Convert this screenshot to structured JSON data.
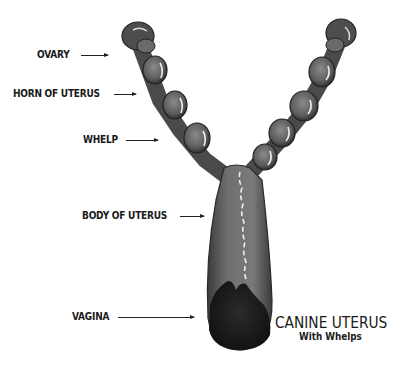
{
  "figure": {
    "title": "CANINE UTERUS",
    "subtitle": "With Whelps",
    "labels": [
      {
        "id": "ovary",
        "text": "OVARY"
      },
      {
        "id": "horn",
        "text": "HORN OF UTERUS"
      },
      {
        "id": "whelp",
        "text": "WHELP"
      },
      {
        "id": "body",
        "text": "BODY OF UTERUS"
      },
      {
        "id": "vagina",
        "text": "VAGINA"
      }
    ],
    "colors": {
      "tissue": "#6b6b6b",
      "tissue_dark": "#2e2e2e",
      "highlight": "#f2f2f2",
      "text": "#1a1a1a"
    }
  }
}
